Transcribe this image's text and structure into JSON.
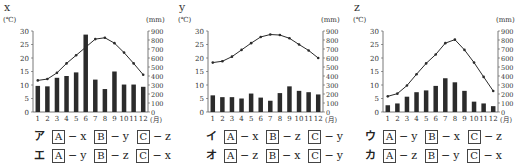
{
  "chart_data": [
    {
      "type": "bar+line",
      "title": "x",
      "categories": [
        "1",
        "2",
        "3",
        "4",
        "5",
        "6",
        "7",
        "8",
        "9",
        "10",
        "11",
        "12"
      ],
      "xlabel": "(月)",
      "ylabel_left": "(℃)",
      "ylabel_right": "(mm)",
      "ylim_left": [
        0,
        30
      ],
      "ylim_right": [
        0,
        900
      ],
      "yticks_left": [
        0,
        5,
        10,
        15,
        20,
        25,
        30
      ],
      "yticks_right": [
        0,
        100,
        200,
        300,
        400,
        500,
        600,
        700,
        800,
        900
      ],
      "series": [
        {
          "name": "temperature",
          "kind": "line",
          "axis": "left",
          "values": [
            11.7,
            12.2,
            14.5,
            18,
            21,
            24,
            27,
            27.5,
            25.5,
            22,
            18,
            13.8
          ]
        },
        {
          "name": "precipitation",
          "kind": "bar",
          "axis": "right",
          "values": [
            290,
            285,
            380,
            400,
            440,
            860,
            360,
            255,
            450,
            305,
            305,
            280
          ]
        }
      ]
    },
    {
      "type": "bar+line",
      "title": "y",
      "categories": [
        "1",
        "2",
        "3",
        "4",
        "5",
        "6",
        "7",
        "8",
        "9",
        "10",
        "11",
        "12"
      ],
      "xlabel": "(月)",
      "ylabel_left": "(℃)",
      "ylabel_right": "(mm)",
      "ylim_left": [
        0,
        30
      ],
      "ylim_right": [
        0,
        900
      ],
      "yticks_left": [
        0,
        5,
        10,
        15,
        20,
        25,
        30
      ],
      "yticks_right": [
        0,
        100,
        200,
        300,
        400,
        500,
        600,
        700,
        800,
        900
      ],
      "series": [
        {
          "name": "temperature",
          "kind": "line",
          "axis": "left",
          "values": [
            18.3,
            18.8,
            20.5,
            23,
            25.5,
            27.8,
            28.7,
            28.5,
            27.3,
            25,
            22.8,
            20
          ]
        },
        {
          "name": "precipitation",
          "kind": "bar",
          "axis": "right",
          "values": [
            185,
            165,
            165,
            150,
            205,
            160,
            125,
            210,
            285,
            235,
            220,
            195
          ]
        }
      ]
    },
    {
      "type": "bar+line",
      "title": "z",
      "categories": [
        "1",
        "2",
        "3",
        "4",
        "5",
        "6",
        "7",
        "8",
        "9",
        "10",
        "11",
        "12"
      ],
      "xlabel": "(月)",
      "ylabel_left": "(℃)",
      "ylabel_right": "(mm)",
      "ylim_left": [
        0,
        30
      ],
      "ylim_right": [
        0,
        900
      ],
      "yticks_left": [
        0,
        5,
        10,
        15,
        20,
        25,
        30
      ],
      "yticks_right": [
        0,
        100,
        200,
        300,
        400,
        500,
        600,
        700,
        800,
        900
      ],
      "series": [
        {
          "name": "temperature",
          "kind": "line",
          "axis": "left",
          "values": [
            5.8,
            6.8,
            9.8,
            14,
            18,
            21.3,
            25.5,
            26.8,
            23,
            18.3,
            13,
            7.8
          ]
        },
        {
          "name": "precipitation",
          "kind": "bar",
          "axis": "right",
          "values": [
            75,
            95,
            170,
            220,
            240,
            290,
            375,
            330,
            235,
            115,
            95,
            65
          ]
        }
      ]
    }
  ],
  "options": [
    {
      "kana": "ア",
      "pairs": [
        {
          "box": "A",
          "val": "x"
        },
        {
          "box": "B",
          "val": "y"
        },
        {
          "box": "C",
          "val": "z"
        }
      ]
    },
    {
      "kana": "イ",
      "pairs": [
        {
          "box": "A",
          "val": "x"
        },
        {
          "box": "B",
          "val": "z"
        },
        {
          "box": "C",
          "val": "y"
        }
      ]
    },
    {
      "kana": "ウ",
      "pairs": [
        {
          "box": "A",
          "val": "y"
        },
        {
          "box": "B",
          "val": "x"
        },
        {
          "box": "C",
          "val": "z"
        }
      ]
    },
    {
      "kana": "エ",
      "pairs": [
        {
          "box": "A",
          "val": "y"
        },
        {
          "box": "B",
          "val": "z"
        },
        {
          "box": "C",
          "val": "x"
        }
      ]
    },
    {
      "kana": "オ",
      "pairs": [
        {
          "box": "A",
          "val": "z"
        },
        {
          "box": "B",
          "val": "x"
        },
        {
          "box": "C",
          "val": "y"
        }
      ]
    },
    {
      "kana": "カ",
      "pairs": [
        {
          "box": "A",
          "val": "z"
        },
        {
          "box": "B",
          "val": "y"
        },
        {
          "box": "C",
          "val": "x"
        }
      ]
    }
  ],
  "colors": {
    "bar": "#2b2b2b",
    "line": "#2b2b2b",
    "axis": "#555555",
    "text": "#333333"
  }
}
